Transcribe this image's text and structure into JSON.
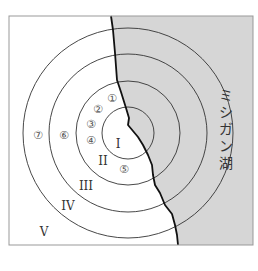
{
  "figure": {
    "frame": {
      "x": 9,
      "y": 16,
      "width": 244,
      "height": 229
    },
    "colors": {
      "lake": "#d6d6d6",
      "land": "#ffffff",
      "line": "#222222",
      "border": "#999999"
    },
    "center": {
      "x": 128,
      "y": 133
    },
    "rings": [
      26,
      52,
      79,
      105
    ],
    "lake_label": "ミシガン湖",
    "zones": [
      {
        "label": "I",
        "x": 118,
        "y": 148
      },
      {
        "label": "II",
        "x": 103,
        "y": 165
      },
      {
        "label": "III",
        "x": 86,
        "y": 190
      },
      {
        "label": "IV",
        "x": 68,
        "y": 210
      },
      {
        "label": "V",
        "x": 44,
        "y": 236
      }
    ],
    "sites": [
      {
        "label": "①",
        "x": 112,
        "y": 102
      },
      {
        "label": "②",
        "x": 98,
        "y": 113
      },
      {
        "label": "③",
        "x": 91,
        "y": 128
      },
      {
        "label": "④",
        "x": 91,
        "y": 144
      },
      {
        "label": "⑤",
        "x": 124,
        "y": 173
      },
      {
        "label": "⑥",
        "x": 64,
        "y": 139
      },
      {
        "label": "⑦",
        "x": 38,
        "y": 139
      }
    ]
  }
}
